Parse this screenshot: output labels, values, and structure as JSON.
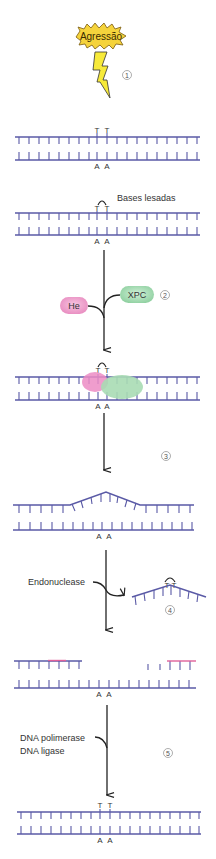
{
  "colors": {
    "dna_strand": "#5a5aa6",
    "repair_patch": "#e0609a",
    "agressao_fill": "#f5d33c",
    "lightning_fill": "#f7ea3a",
    "he_fill": "#f0a6cf",
    "xpc_fill": "#a8dcb4",
    "arrow": "#222222"
  },
  "agressao": {
    "label": "Agressão"
  },
  "steps": [
    {
      "number": "①"
    },
    {
      "number": "②"
    },
    {
      "number": "③"
    },
    {
      "number": "④"
    },
    {
      "number": "⑤"
    }
  ],
  "bases": {
    "top_pair": [
      "T",
      "T"
    ],
    "bottom_pair": [
      "A",
      "A"
    ]
  },
  "labels": {
    "bases_lesadas": "Bases lesadas",
    "he": "He",
    "xpc": "XPC",
    "endonuclease": "Endonuclease",
    "dna_polimerase": "DNA polimerase",
    "dna_ligase": "DNA ligase"
  }
}
